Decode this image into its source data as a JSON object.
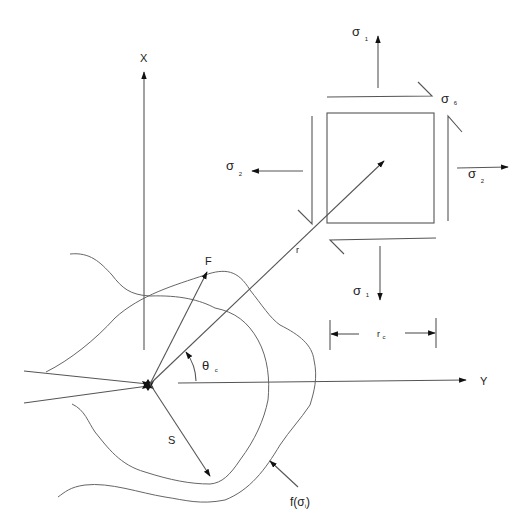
{
  "diagram": {
    "axes": {
      "x_label": "X",
      "y_label": "Y"
    },
    "element": {
      "shear_label": "σ",
      "shear_sub": "6",
      "top_stress_label": "σ",
      "top_stress_sub": "1",
      "bottom_stress_label": "σ",
      "bottom_stress_sub": "1",
      "left_stress_label": "σ",
      "left_stress_sub": "2",
      "right_stress_label": "σ",
      "right_stress_sub": "2",
      "dimension_label": "r",
      "dimension_sub": "c"
    },
    "crack_tip": {
      "radius_label": "r",
      "angle_label": "θ",
      "angle_sub": "c",
      "failure_vector_label": "F",
      "safe_vector_label": "S",
      "failure_curve_label_prefix": "f(σ",
      "failure_curve_label_sub": "i",
      "failure_curve_label_suffix": ")"
    },
    "colors": {
      "line": "#555555",
      "text": "#222222",
      "background": "#ffffff"
    }
  }
}
